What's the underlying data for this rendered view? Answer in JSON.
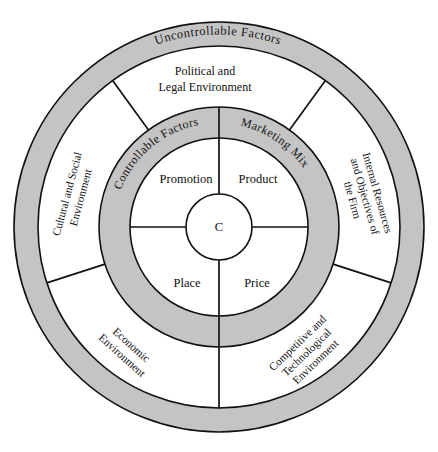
{
  "diagram": {
    "center": {
      "label": "C",
      "name": "consumer-core"
    },
    "rings": [
      {
        "id": "marketing-mix",
        "arc_labels": [
          {
            "id": "controllable-factors",
            "text": "Controllable Factors"
          },
          {
            "id": "marketing-mix",
            "text": "Marketing Mix"
          }
        ]
      },
      {
        "id": "uncontrollable",
        "arc_labels": [
          {
            "id": "uncontrollable-factors",
            "text": "Uncontrollable Factors"
          }
        ]
      }
    ],
    "marketing_mix": [
      {
        "id": "promotion",
        "label": "Promotion"
      },
      {
        "id": "product",
        "label": "Product"
      },
      {
        "id": "place",
        "label": "Place"
      },
      {
        "id": "price",
        "label": "Price"
      }
    ],
    "environment_sectors": [
      {
        "id": "political-legal",
        "lines": [
          "Political and",
          "Legal Environment"
        ]
      },
      {
        "id": "internal-resources",
        "lines": [
          "Internal Resources",
          "and Objectives of",
          "the Firm"
        ]
      },
      {
        "id": "competitive-technological",
        "lines": [
          "Competitive and",
          "Technological",
          "Environment"
        ]
      },
      {
        "id": "economic",
        "lines": [
          "Economic",
          "Environment"
        ]
      },
      {
        "id": "cultural-social",
        "lines": [
          "Cultural and Social",
          "Environment"
        ]
      }
    ],
    "colors": {
      "ring_gray": "#c4c4c4",
      "line": "#111111",
      "background": "#ffffff"
    }
  }
}
